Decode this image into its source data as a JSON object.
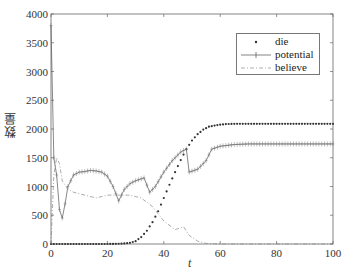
{
  "chart_data": {
    "type": "line",
    "title": "",
    "xlabel": "t",
    "ylabel": "数量",
    "xlim": [
      0,
      100
    ],
    "ylim": [
      0,
      4000
    ],
    "xticks": [
      0,
      20,
      40,
      60,
      80,
      100
    ],
    "yticks": [
      0,
      500,
      1000,
      1500,
      2000,
      2500,
      3000,
      3500,
      4000
    ],
    "grid": false,
    "legend_position": "upper right",
    "series": [
      {
        "name": "die",
        "style": "dotted-markers",
        "color": "#333333",
        "x": [
          0,
          5,
          10,
          15,
          20,
          25,
          28,
          30,
          32,
          34,
          36,
          38,
          40,
          42,
          44,
          46,
          48,
          50,
          52,
          54,
          56,
          58,
          60,
          62,
          65,
          70,
          75,
          80,
          85,
          90,
          95,
          100
        ],
        "values": [
          0,
          0,
          0,
          0,
          0,
          5,
          20,
          50,
          120,
          230,
          380,
          570,
          800,
          1030,
          1250,
          1460,
          1650,
          1800,
          1910,
          1990,
          2040,
          2060,
          2075,
          2085,
          2090,
          2090,
          2090,
          2090,
          2090,
          2090,
          2090,
          2090
        ]
      },
      {
        "name": "potential",
        "style": "solid-plus-markers",
        "color": "#555555",
        "x": [
          0,
          1,
          2,
          3,
          4,
          5,
          6,
          7,
          8,
          10,
          12,
          14,
          16,
          18,
          20,
          22,
          24,
          26,
          28,
          30,
          33,
          35,
          37,
          40,
          43,
          46,
          48,
          49,
          52,
          55,
          57,
          60,
          65,
          70,
          75,
          80,
          85,
          90,
          95,
          100
        ],
        "values": [
          3800,
          1500,
          1200,
          600,
          450,
          700,
          1000,
          1100,
          1200,
          1250,
          1260,
          1280,
          1270,
          1250,
          1180,
          1000,
          750,
          950,
          1050,
          1100,
          1150,
          900,
          1000,
          1250,
          1450,
          1600,
          1650,
          1250,
          1300,
          1450,
          1650,
          1700,
          1730,
          1740,
          1740,
          1740,
          1740,
          1740,
          1740,
          1740
        ]
      },
      {
        "name": "believe",
        "style": "dash-dot",
        "color": "#888888",
        "x": [
          0,
          1,
          2,
          3,
          4,
          6,
          8,
          12,
          16,
          20,
          24,
          28,
          32,
          36,
          40,
          44,
          47,
          49,
          52,
          55,
          60,
          65,
          70,
          80,
          90,
          100
        ],
        "values": [
          0,
          1200,
          1500,
          1400,
          1100,
          950,
          900,
          850,
          800,
          850,
          850,
          850,
          800,
          650,
          400,
          250,
          300,
          150,
          50,
          10,
          0,
          0,
          0,
          0,
          0,
          0
        ]
      }
    ]
  },
  "axes": {
    "x_label": "t",
    "y_label": "数量"
  },
  "legend": {
    "items": [
      {
        "label": "die"
      },
      {
        "label": "potential"
      },
      {
        "label": "believe"
      }
    ]
  }
}
